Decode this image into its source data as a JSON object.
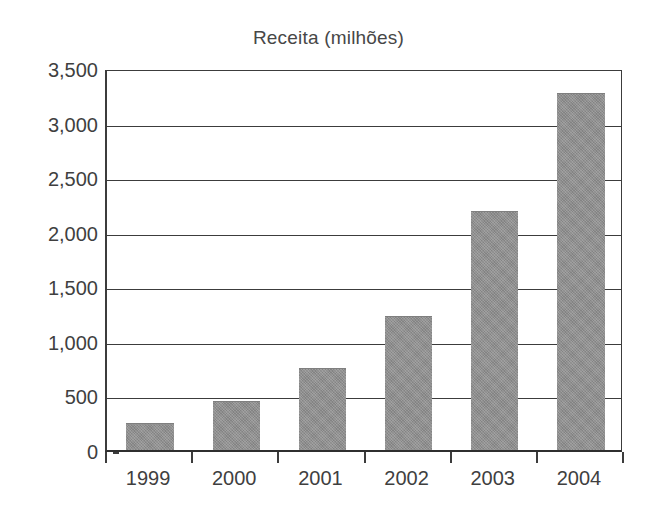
{
  "chart_data": {
    "type": "bar",
    "title": "Receita (milhões)",
    "xlabel": "",
    "ylabel": "",
    "categories": [
      "1999",
      "2000",
      "2001",
      "2002",
      "2003",
      "2004"
    ],
    "values": [
      240,
      440,
      740,
      1220,
      2180,
      3260
    ],
    "series": [
      {
        "name": "Receita",
        "values": [
          240,
          440,
          740,
          1220,
          2180,
          3260
        ]
      }
    ],
    "ylim": [
      0,
      3500
    ],
    "ytick_values": [
      0,
      500,
      1000,
      1500,
      2000,
      2500,
      3000,
      3500
    ],
    "ytick_labels": [
      "0",
      "500",
      "1,000",
      "1,500",
      "2,000",
      "2,500",
      "3,000",
      "3,500"
    ],
    "grid": true,
    "grid_axis": "y",
    "legend": false,
    "legend_position": "none",
    "bar_color": "#8d8d8d",
    "axis_color": "#3c3c3c",
    "text_color": "#3f3f3f",
    "background_color": "#ffffff"
  }
}
